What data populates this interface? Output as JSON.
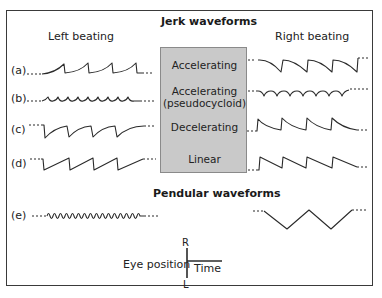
{
  "titles": {
    "jerk": "Jerk waveforms",
    "pendular": "Pendular waveforms"
  },
  "columns": {
    "left": "Left beating",
    "right": "Right beating"
  },
  "rows": [
    {
      "label": "(a)",
      "type": "Accelerating"
    },
    {
      "label": "(b)",
      "type": "Accelerating",
      "type_line2": "(pseudocycloid)"
    },
    {
      "label": "(c)",
      "type": "Decelerating"
    },
    {
      "label": "(d)",
      "type": "Linear"
    },
    {
      "label": "(e)",
      "type": ""
    }
  ],
  "legend": {
    "axis_label": "Eye position",
    "top": "R",
    "bottom": "L",
    "x_label": "Time"
  },
  "colors": {
    "box_fill": "#c9c9c9",
    "line": "#2a2a2a"
  }
}
